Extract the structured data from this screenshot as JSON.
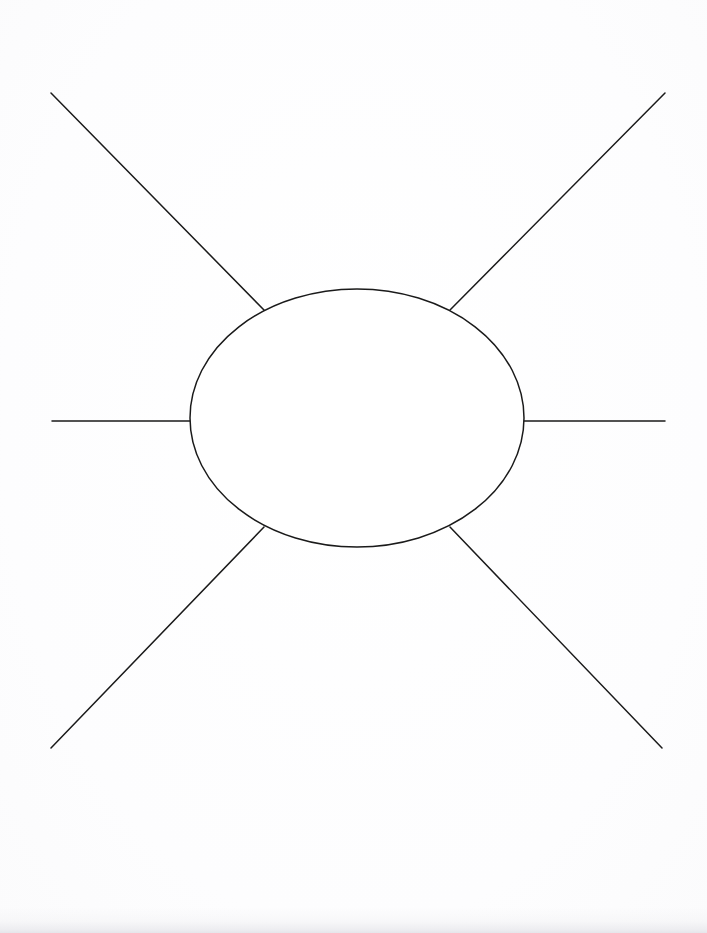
{
  "document": {
    "type": "graphic-organizer-worksheet",
    "title": "Blank Mind Map Organizer",
    "page_width": 707,
    "page_height": 933,
    "background_color": "#fefefe",
    "ink_color": "#1a1a1a",
    "stroke_width": 1.5,
    "text_content": [],
    "labels_present": false
  },
  "diagram": {
    "name": "radiating-spoke-organizer",
    "center_node": {
      "name": "central-oval",
      "shape": "ellipse",
      "cx": 357,
      "cy": 418,
      "rx": 167,
      "ry": 129,
      "fill": "none",
      "stroke": "#1a1a1a",
      "label": ""
    },
    "spokes": [
      {
        "name": "spoke-northwest",
        "direction": "northwest",
        "x1": 51,
        "y1": 93,
        "x2": 264,
        "y2": 310,
        "label": ""
      },
      {
        "name": "spoke-northeast",
        "direction": "northeast",
        "x1": 665,
        "y1": 93,
        "x2": 450,
        "y2": 310,
        "label": ""
      },
      {
        "name": "spoke-west",
        "direction": "west",
        "x1": 52,
        "y1": 421,
        "x2": 190,
        "y2": 421,
        "label": ""
      },
      {
        "name": "spoke-east",
        "direction": "east",
        "x1": 524,
        "y1": 421,
        "x2": 665,
        "y2": 421,
        "label": ""
      },
      {
        "name": "spoke-southwest",
        "direction": "southwest",
        "x1": 51,
        "y1": 748,
        "x2": 264,
        "y2": 527,
        "label": ""
      },
      {
        "name": "spoke-southeast",
        "direction": "southeast",
        "x1": 662,
        "y1": 748,
        "x2": 450,
        "y2": 527,
        "label": ""
      }
    ],
    "spoke_count": 6
  },
  "scan_artifacts": {
    "bottom_shadow": true,
    "bottom_shadow_color": "#e8e8ec",
    "paper_tint": "#fdfdfe"
  }
}
